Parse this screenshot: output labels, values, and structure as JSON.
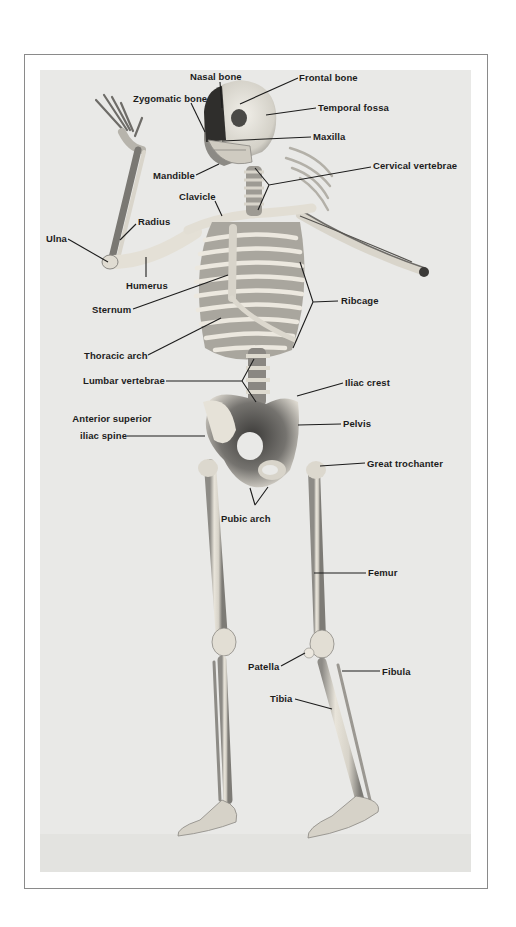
{
  "figure": {
    "type": "labeled anatomical photograph",
    "colors": {
      "background": "#ffffff",
      "panel": "#e9e9e7",
      "bone": "#e6e2d8",
      "shadow": "#6b6a66",
      "label": "#1c1c1c",
      "frame": "#8a8a8a"
    },
    "labels": [
      {
        "id": "nasal-bone",
        "text": "Nasal bone",
        "x": 190,
        "y": 71,
        "line": [
          [
            220,
            82
          ],
          [
            222,
            108
          ]
        ]
      },
      {
        "id": "frontal-bone",
        "text": "Frontal bone",
        "x": 299,
        "y": 72,
        "line": [
          [
            298,
            78
          ],
          [
            240,
            104
          ]
        ]
      },
      {
        "id": "zygomatic-bone",
        "text": "Zygomatic bone",
        "x": 133,
        "y": 93,
        "line": [
          [
            191,
            103
          ],
          [
            205,
            132
          ]
        ]
      },
      {
        "id": "temporal-fossa",
        "text": "Temporal fossa",
        "x": 318,
        "y": 102,
        "line": [
          [
            316,
            108
          ],
          [
            266,
            115
          ]
        ]
      },
      {
        "id": "maxilla",
        "text": "Maxilla",
        "x": 313,
        "y": 131,
        "line": [
          [
            311,
            137
          ],
          [
            222,
            141
          ]
        ]
      },
      {
        "id": "mandible",
        "text": "Mandible",
        "x": 153,
        "y": 170,
        "line": [
          [
            196,
            175
          ],
          [
            219,
            164
          ]
        ]
      },
      {
        "id": "cervical-vertebrae",
        "text": "Cervical vertebrae",
        "x": 373,
        "y": 160,
        "lines": [
          [
            [
              371,
              167
            ],
            [
              269,
              185
            ]
          ],
          [
            [
              269,
              185
            ],
            [
              255,
              168
            ]
          ],
          [
            [
              269,
              185
            ],
            [
              258,
              210
            ]
          ]
        ]
      },
      {
        "id": "clavicle",
        "text": "Clavicle",
        "x": 179,
        "y": 191,
        "line": [
          [
            215,
            201
          ],
          [
            222,
            216
          ]
        ]
      },
      {
        "id": "radius",
        "text": "Radius",
        "x": 138,
        "y": 216,
        "line": [
          [
            136,
            224
          ],
          [
            120,
            240
          ]
        ]
      },
      {
        "id": "ulna",
        "text": "Ulna",
        "x": 46,
        "y": 233,
        "line": [
          [
            68,
            239
          ],
          [
            108,
            262
          ]
        ]
      },
      {
        "id": "humerus",
        "text": "Humerus",
        "x": 126,
        "y": 280,
        "line": [
          [
            146,
            277
          ],
          [
            146,
            257
          ]
        ]
      },
      {
        "id": "sternum",
        "text": "Sternum",
        "x": 92,
        "y": 304,
        "line": [
          [
            133,
            309
          ],
          [
            228,
            275
          ]
        ]
      },
      {
        "id": "ribcage",
        "text": "Ribcage",
        "x": 341,
        "y": 295,
        "lines": [
          [
            [
              338,
              301
            ],
            [
              313,
              302
            ]
          ],
          [
            [
              313,
              302
            ],
            [
              300,
              262
            ]
          ],
          [
            [
              313,
              302
            ],
            [
              293,
              348
            ]
          ]
        ]
      },
      {
        "id": "thoracic-arch",
        "text": "Thoracic arch",
        "x": 84,
        "y": 350,
        "line": [
          [
            148,
            355
          ],
          [
            221,
            318
          ]
        ]
      },
      {
        "id": "lumbar-vertebrae",
        "text": "Lumbar vertebrae",
        "x": 83,
        "y": 375,
        "lines": [
          [
            [
              166,
              381
            ],
            [
              242,
              381
            ]
          ],
          [
            [
              242,
              381
            ],
            [
              254,
              359
            ]
          ],
          [
            [
              242,
              381
            ],
            [
              256,
              402
            ]
          ]
        ]
      },
      {
        "id": "iliac-crest",
        "text": "Iliac crest",
        "x": 345,
        "y": 377,
        "line": [
          [
            343,
            383
          ],
          [
            297,
            396
          ]
        ]
      },
      {
        "id": "anterior-superior-iliac-spine",
        "text": "Anterior superior iliac spine",
        "lines_text": [
          "Anterior superior",
          "iliac spine"
        ],
        "x": 64,
        "y": 413,
        "line": [
          [
            127,
            436
          ],
          [
            205,
            436
          ]
        ]
      },
      {
        "id": "pelvis",
        "text": "Pelvis",
        "x": 343,
        "y": 418,
        "line": [
          [
            341,
            424
          ],
          [
            298,
            425
          ]
        ]
      },
      {
        "id": "great-trochanter",
        "text": "Great trochanter",
        "x": 367,
        "y": 458,
        "line": [
          [
            365,
            463
          ],
          [
            320,
            466
          ]
        ]
      },
      {
        "id": "pubic-arch",
        "text": "Pubic arch",
        "x": 221,
        "y": 513,
        "lines": [
          [
            [
              255,
              505
            ],
            [
              250,
              488
            ]
          ],
          [
            [
              255,
              505
            ],
            [
              268,
              487
            ]
          ]
        ]
      },
      {
        "id": "femur",
        "text": "Femur",
        "x": 368,
        "y": 567,
        "line": [
          [
            366,
            573
          ],
          [
            314,
            573
          ]
        ]
      },
      {
        "id": "patella",
        "text": "Patella",
        "x": 248,
        "y": 661,
        "line": [
          [
            281,
            666
          ],
          [
            305,
            653
          ]
        ]
      },
      {
        "id": "fibula",
        "text": "Fibula",
        "x": 382,
        "y": 666,
        "line": [
          [
            380,
            671
          ],
          [
            342,
            671
          ]
        ]
      },
      {
        "id": "tibia",
        "text": "Tibia",
        "x": 270,
        "y": 693,
        "line": [
          [
            295,
            699
          ],
          [
            332,
            709
          ]
        ]
      }
    ]
  }
}
